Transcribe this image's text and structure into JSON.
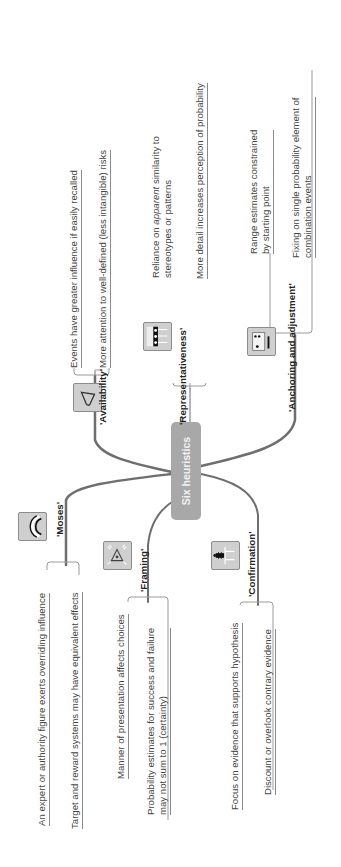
{
  "center": {
    "label": "Six heuristics"
  },
  "branches": [
    {
      "id": "availability",
      "label": "'Availability'",
      "icon": "triangle-shape-icon",
      "leaves": [
        "Events have greater influence if easily recalled",
        "More attention to well-defined (less intangible) risks"
      ]
    },
    {
      "id": "representativeness",
      "label": "'Representativeness'",
      "icon": "pattern-grid-icon",
      "leaves": [
        "Reliance on apparent similarity to stereotypes or patterns",
        "More detail increases perception of probability"
      ],
      "leaf0_parts": {
        "pre": "Reliance on ",
        "em": "apparent",
        "post": " similarity to",
        "line2": "stereotypes or patterns"
      }
    },
    {
      "id": "anchoring",
      "label": "'Anchoring and adjustment'",
      "icon": "anchor-gauge-icon",
      "leaves": [
        "Range estimates constrained by starting point",
        "Fixing on single probability element of combination events"
      ],
      "leaf0_lines": [
        "Range  estimates  constrained",
        "by starting point"
      ],
      "leaf1_lines": [
        "Fixing on single probability element of",
        "combination events"
      ]
    },
    {
      "id": "moses",
      "label": "'Moses'",
      "icon": "arc-rings-icon",
      "leaves": [
        "An expert or authority figure exerts overriding influence",
        "Target and reward systems may have equivalent effects"
      ]
    },
    {
      "id": "framing",
      "label": "'Framing'",
      "icon": "warning-triangle-icon",
      "leaves": [
        "Manner of presentation affects choices",
        "Probability estimates for success and failure may not sum to 1 (certainty)"
      ],
      "leaf1_lines": [
        "Probability  estimates  for  success  and  failure",
        "may not sum to 1 (certainty)"
      ]
    },
    {
      "id": "confirmation",
      "label": "'Confirmation'",
      "icon": "person-flowchart-icon",
      "leaves": [
        "Focus on evidence that supports hypothesis",
        "Discount or overlook contrary evidence"
      ]
    }
  ],
  "colors": {
    "center_fill": "#a8a8a8",
    "branch_line": "#6e6e6e",
    "icon_fill": "#cfcfcf"
  }
}
